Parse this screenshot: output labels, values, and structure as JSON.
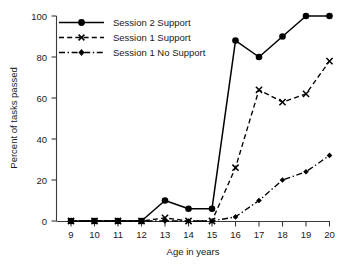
{
  "chart_data": {
    "type": "line",
    "title": "",
    "xlabel": "Age in years",
    "ylabel": "Percent of tasks passed",
    "x": [
      9,
      10,
      11,
      12,
      13,
      14,
      15,
      16,
      17,
      18,
      19,
      20
    ],
    "xtick_labels": [
      "9",
      "10",
      "11",
      "12",
      "13",
      "14",
      "15",
      "16",
      "17",
      "18",
      "19",
      "20"
    ],
    "ytick_labels": [
      "0",
      "20",
      "40",
      "60",
      "80",
      "100"
    ],
    "yticks": [
      0,
      20,
      40,
      60,
      80,
      100
    ],
    "xlim": [
      9,
      20
    ],
    "ylim": [
      0,
      100
    ],
    "grid": false,
    "legend_position": "top-left",
    "series": [
      {
        "name": "Session 2 Support",
        "marker": "filled-circle",
        "linestyle": "solid",
        "color": "#000000",
        "values": [
          0,
          0,
          0,
          0,
          10,
          6,
          6,
          88,
          80,
          90,
          100,
          100
        ]
      },
      {
        "name": "Session 1 Support",
        "marker": "cross-x",
        "linestyle": "dashed",
        "color": "#000000",
        "values": [
          0,
          0,
          0,
          0,
          1.5,
          0,
          0,
          26,
          64,
          58,
          62,
          78
        ]
      },
      {
        "name": "Session 1 No Support",
        "marker": "small-diamond",
        "linestyle": "dash-dot",
        "color": "#000000",
        "values": [
          0,
          0,
          0,
          0,
          0,
          0,
          0,
          2,
          10,
          20,
          24,
          32
        ]
      }
    ]
  },
  "axes": {
    "ylabel": "Percent of tasks passed",
    "xlabel": "Age in years",
    "ytick_labels": [
      "100",
      "80",
      "60",
      "40",
      "20",
      "0"
    ],
    "xtick_labels": [
      "9",
      "10",
      "11",
      "12",
      "13",
      "14",
      "15",
      "16",
      "17",
      "18",
      "19",
      "20"
    ]
  },
  "legend": {
    "items": [
      {
        "label": "Session 2 Support"
      },
      {
        "label": "Session 1 Support"
      },
      {
        "label": "Session 1 No Support"
      }
    ]
  }
}
